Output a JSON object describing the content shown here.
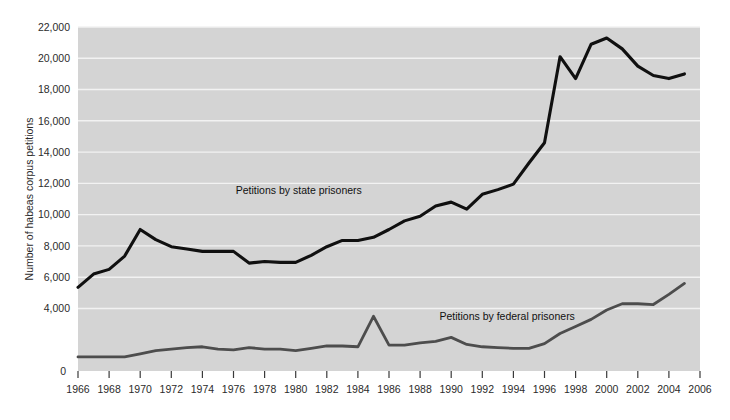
{
  "chart_data": {
    "type": "line",
    "title": "",
    "xlabel": "",
    "ylabel": "Number of habeas corpus petitions",
    "xlim": [
      1966,
      2006
    ],
    "ylim": [
      0,
      22000
    ],
    "ytick_step": 2000,
    "xtick_step": 2,
    "grid": true,
    "grid_axis": "y",
    "legend_position": "inline-annotation",
    "plot_background": "#d4d4d4",
    "gridline_color": "#f2f2f2",
    "y_zero_label": "0",
    "ytick_labels": [
      "4,000",
      "6,000",
      "8,000",
      "10,000",
      "12,000",
      "14,000",
      "16,000",
      "18,000",
      "20,000",
      "22,000"
    ],
    "ytick_values": [
      4000,
      6000,
      8000,
      10000,
      12000,
      14000,
      16000,
      18000,
      20000,
      22000
    ],
    "xtick_labels": [
      "1966",
      "1968",
      "1970",
      "1972",
      "1974",
      "1976",
      "1978",
      "1980",
      "1982",
      "1984",
      "1986",
      "1988",
      "1990",
      "1992",
      "1994",
      "1996",
      "1998",
      "2000",
      "2002",
      "2004",
      "2006"
    ],
    "xtick_values": [
      1966,
      1968,
      1970,
      1972,
      1974,
      1976,
      1978,
      1980,
      1982,
      1984,
      1986,
      1988,
      1990,
      1992,
      1994,
      1996,
      1998,
      2000,
      2002,
      2004,
      2006
    ],
    "x": [
      1966,
      1967,
      1968,
      1969,
      1970,
      1971,
      1972,
      1973,
      1974,
      1975,
      1976,
      1977,
      1978,
      1979,
      1980,
      1981,
      1982,
      1983,
      1984,
      1985,
      1986,
      1987,
      1988,
      1989,
      1990,
      1991,
      1992,
      1993,
      1994,
      1995,
      1996,
      1997,
      1998,
      1999,
      2000,
      2001,
      2002,
      2003,
      2004,
      2005
    ],
    "series": [
      {
        "name": "Petitions by state prisoners",
        "label": "Petitions by state prisoners",
        "color": "#101010",
        "width": 3.1,
        "label_x": 1980.2,
        "label_y": 11350,
        "values": [
          5350,
          6200,
          6500,
          7350,
          9050,
          8400,
          7950,
          7800,
          7650,
          7650,
          7650,
          6900,
          7000,
          6950,
          6950,
          7400,
          7950,
          8350,
          8350,
          8550,
          9050,
          9600,
          9900,
          10550,
          10800,
          10350,
          11300,
          11600,
          11950,
          13300,
          14600,
          20100,
          18700,
          20900,
          21300,
          20600,
          19500,
          18900,
          18700,
          19000
        ]
      },
      {
        "name": "Petitions by federal prisoners",
        "label": "Petitions by federal prisoners",
        "color": "#4d4d4d",
        "width": 2.8,
        "label_x": 1993.6,
        "label_y": 3250,
        "values": [
          900,
          900,
          900,
          900,
          1100,
          1300,
          1400,
          1500,
          1550,
          1400,
          1350,
          1500,
          1400,
          1400,
          1300,
          1450,
          1600,
          1600,
          1550,
          3500,
          1650,
          1650,
          1800,
          1900,
          2150,
          1700,
          1550,
          1500,
          1450,
          1450,
          1750,
          2400,
          2850,
          3300,
          3900,
          4300,
          4300,
          4250,
          4900,
          5600
        ]
      }
    ]
  },
  "figure": {
    "caption": ""
  }
}
